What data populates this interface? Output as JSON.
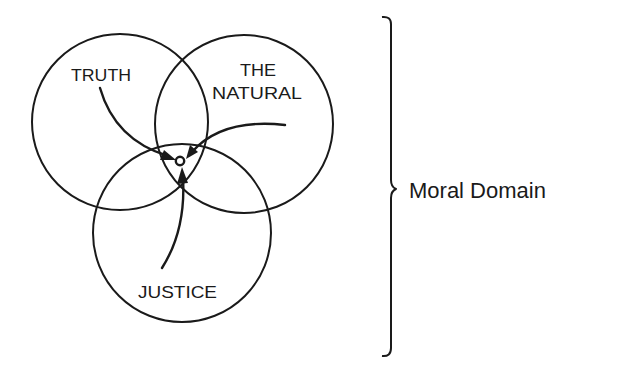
{
  "diagram": {
    "type": "venn",
    "circles": [
      {
        "id": "truth",
        "label_lines": [
          "TRUTH"
        ]
      },
      {
        "id": "natural",
        "label_lines": [
          "THE",
          "NATURAL"
        ]
      },
      {
        "id": "justice",
        "label_lines": [
          "JUSTICE"
        ]
      }
    ],
    "labels": {
      "truth": "TRUTH",
      "natural_line1": "THE",
      "natural_line2": "NATURAL",
      "justice": "JUSTICE"
    },
    "arrows": [
      {
        "from": "TRUTH",
        "to": "center-point"
      },
      {
        "from": "THE NATURAL",
        "to": "center-point"
      },
      {
        "from": "JUSTICE",
        "to": "center-point"
      }
    ],
    "bracket": {
      "label": "Moral Domain"
    },
    "colors": {
      "ink": "#1a1a1a",
      "background": "#ffffff"
    }
  }
}
